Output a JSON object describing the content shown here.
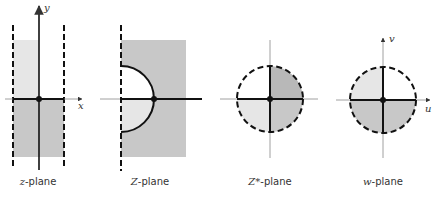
{
  "figure": {
    "colors": {
      "light_gray": "#e6e6e6",
      "medium_gray": "#c8c8c8",
      "dark_gray": "#b8b8b8",
      "line": "#111111",
      "thin_line": "#888888"
    },
    "panels": [
      {
        "id": "z",
        "label_var": "z",
        "label_rest": "-plane",
        "axis_labels": {
          "horizontal": "x",
          "vertical": "y"
        },
        "description": "Vertical strip bounded by two dashed lines; upper-left quadrant light gray, lower half medium gray"
      },
      {
        "id": "Z",
        "label_var": "Z",
        "label_rest": "-plane",
        "axis_labels": {},
        "description": "Half-plane right of dashed line, gray rectangle with semicircle cut-out; lower half of semicircle light gray"
      },
      {
        "id": "Zstar",
        "label_var": "Z*",
        "label_rest": "-plane",
        "axis_labels": {},
        "description": "Dashed circle; upper-right quadrant dark gray, lower-right medium gray, lower-left light gray, upper-left white"
      },
      {
        "id": "w",
        "label_var": "w",
        "label_rest": "-plane",
        "axis_labels": {
          "horizontal": "u",
          "vertical": "v"
        },
        "description": "Dashed circle; upper-left quadrant light gray, lower half medium gray, upper-right white"
      }
    ]
  }
}
